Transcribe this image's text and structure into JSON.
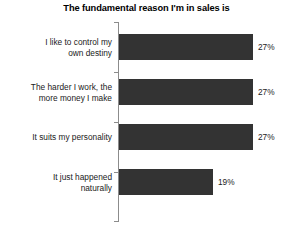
{
  "chart_data": {
    "type": "bar",
    "orientation": "horizontal",
    "title": "The fundamental reason I'm in sales is",
    "xlabel": "",
    "ylabel": "",
    "xlim": [
      0,
      35
    ],
    "grid": false,
    "legend": false,
    "bar_color": "#333333",
    "axis_color": "#8c8c8c",
    "background": "#ffffff",
    "value_suffix": "%",
    "categories": [
      "I like to control my\nown destiny",
      "The harder I work, the\nmore money I make",
      "It suits my personality",
      "It just happened\nnaturally"
    ],
    "values": [
      27,
      27,
      27,
      19
    ],
    "value_labels": [
      "27%",
      "27%",
      "27%",
      "19%"
    ]
  }
}
